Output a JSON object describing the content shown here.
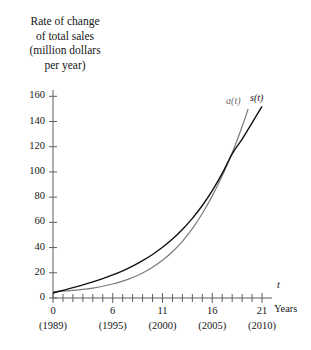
{
  "figure": {
    "axis_title_lines": [
      "Rate of change",
      "of total sales",
      "(million dollars",
      "per year)"
    ],
    "x_axis_variable": "t",
    "x_axis_name": "Years"
  },
  "chart_data": {
    "type": "line",
    "title": "Rate of change of total sales (million dollars per year)",
    "xlabel": "Years",
    "ylabel": "Rate of change of total sales (million dollars per year)",
    "xlim": [
      0,
      22
    ],
    "ylim": [
      0,
      165
    ],
    "grid": false,
    "legend": "inline-curve-labels",
    "x_tick_labels": [
      "0",
      "6",
      "11",
      "16",
      "21"
    ],
    "x_tick_values": [
      0,
      6,
      11,
      16,
      21
    ],
    "x_tick_sublabels": [
      "(1989)",
      "(1995)",
      "(2000)",
      "(2005)",
      "(2010)"
    ],
    "x_minor_tick_step": 1,
    "y_tick_labels": [
      "0",
      "20",
      "40",
      "60",
      "80",
      "100",
      "120",
      "140",
      "160"
    ],
    "y_tick_values": [
      0,
      20,
      40,
      60,
      80,
      100,
      120,
      140,
      160
    ],
    "series": [
      {
        "name": "a(t)",
        "color": "#7a7a7a",
        "label": "a(t)",
        "x": [
          0,
          1,
          2,
          3,
          4,
          5,
          6,
          7,
          8,
          9,
          10,
          11,
          12,
          13,
          14,
          15,
          16,
          17,
          18,
          19,
          19.6
        ],
        "values": [
          5,
          5.4,
          6,
          6.8,
          7.9,
          9.3,
          11.1,
          13.4,
          16.3,
          19.9,
          24.4,
          29.9,
          36.7,
          45.0,
          55.0,
          67.0,
          81.0,
          97.0,
          115.0,
          136.0,
          150.0
        ]
      },
      {
        "name": "s(t)",
        "color": "#111111",
        "label": "s(t)",
        "x": [
          0,
          1,
          2,
          3,
          4,
          5,
          6,
          7,
          8,
          9,
          10,
          11,
          12,
          13,
          14,
          15,
          16,
          17,
          18,
          19,
          20,
          21
        ],
        "values": [
          4,
          6.1,
          8.2,
          10.4,
          12.8,
          15.4,
          18.3,
          21.6,
          25.3,
          29.6,
          34.5,
          40.2,
          46.8,
          54.4,
          63.2,
          73.4,
          85.2,
          98.8,
          114.4,
          126.0,
          139.0,
          152.0
        ]
      }
    ]
  }
}
